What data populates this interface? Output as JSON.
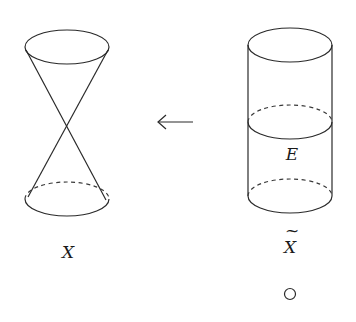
{
  "diagram": {
    "left_figure": {
      "name": "double-cone",
      "label": "X"
    },
    "arrow": {
      "direction": "left",
      "glyph": "←"
    },
    "right_figure": {
      "name": "cylinder",
      "label": "X̃",
      "label_base": "X",
      "label_accent": "~",
      "middle_circle_label": "E"
    },
    "footer_symbol": "○"
  }
}
